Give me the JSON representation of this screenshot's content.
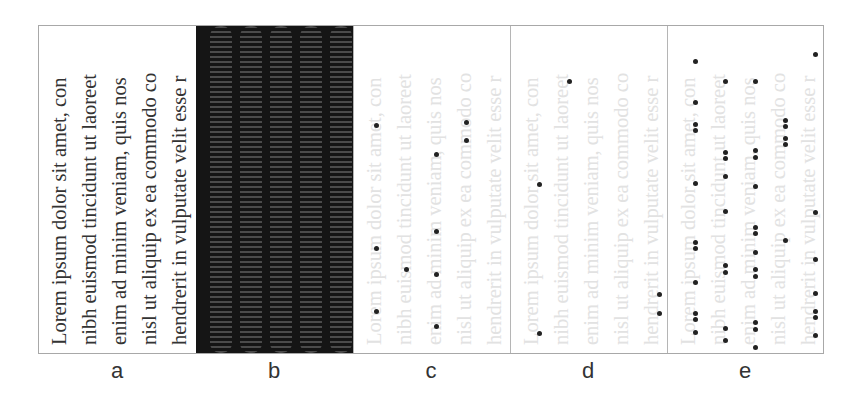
{
  "figure": {
    "lines": [
      "Lorem ipsum dolor sit amet, con",
      "nibh euismod tincidunt ut laoreet",
      "enim ad minim veniam, quis nos",
      "nisl ut aliquip ex ea commodo co",
      "hendrerit in vulputate velit esse r"
    ],
    "panels": [
      {
        "id": "a",
        "label": "a",
        "kind": "text",
        "description": "original text, rendered dark"
      },
      {
        "id": "b",
        "label": "b",
        "kind": "fringe-image",
        "description": "dark background with 5 vertical bright interference-fringe stripes"
      },
      {
        "id": "c",
        "label": "c",
        "kind": "faint-text-with-dots",
        "dots": [
          [
            22,
            99
          ],
          [
            22,
            222
          ],
          [
            22,
            285
          ],
          [
            52,
            243
          ],
          [
            82,
            128
          ],
          [
            82,
            205
          ],
          [
            82,
            248
          ],
          [
            82,
            300
          ],
          [
            112,
            96
          ],
          [
            112,
            114
          ]
        ]
      },
      {
        "id": "d",
        "label": "d",
        "kind": "faint-text-with-dots",
        "dots": [
          [
            28,
            158
          ],
          [
            28,
            307
          ],
          [
            58,
            55
          ],
          [
            148,
            268
          ],
          [
            148,
            287
          ]
        ]
      },
      {
        "id": "e",
        "label": "e",
        "kind": "faint-text-with-dots",
        "dots": [
          [
            27,
            35
          ],
          [
            27,
            76
          ],
          [
            27,
            98
          ],
          [
            27,
            104
          ],
          [
            27,
            157
          ],
          [
            27,
            216
          ],
          [
            27,
            222
          ],
          [
            27,
            256
          ],
          [
            27,
            287
          ],
          [
            27,
            293
          ],
          [
            27,
            306
          ],
          [
            27,
            331
          ],
          [
            57,
            55
          ],
          [
            57,
            126
          ],
          [
            57,
            132
          ],
          [
            57,
            150
          ],
          [
            57,
            185
          ],
          [
            57,
            239
          ],
          [
            57,
            246
          ],
          [
            57,
            302
          ],
          [
            57,
            314
          ],
          [
            87,
            55
          ],
          [
            87,
            124
          ],
          [
            87,
            131
          ],
          [
            87,
            160
          ],
          [
            87,
            201
          ],
          [
            87,
            207
          ],
          [
            87,
            226
          ],
          [
            87,
            243
          ],
          [
            87,
            250
          ],
          [
            87,
            296
          ],
          [
            87,
            303
          ],
          [
            87,
            321
          ],
          [
            117,
            94
          ],
          [
            117,
            100
          ],
          [
            117,
            112
          ],
          [
            117,
            118
          ],
          [
            117,
            214
          ],
          [
            117,
            331
          ],
          [
            147,
            28
          ],
          [
            147,
            186
          ],
          [
            147,
            233
          ],
          [
            147,
            267
          ],
          [
            147,
            285
          ],
          [
            147,
            291
          ],
          [
            147,
            309
          ],
          [
            147,
            331
          ]
        ]
      }
    ],
    "colors": {
      "border": "#a8a8a8",
      "dark_text": "#333333",
      "faint_text": "#e2e2e2",
      "dot": "#222222",
      "fringe_bg": "#151515"
    }
  }
}
